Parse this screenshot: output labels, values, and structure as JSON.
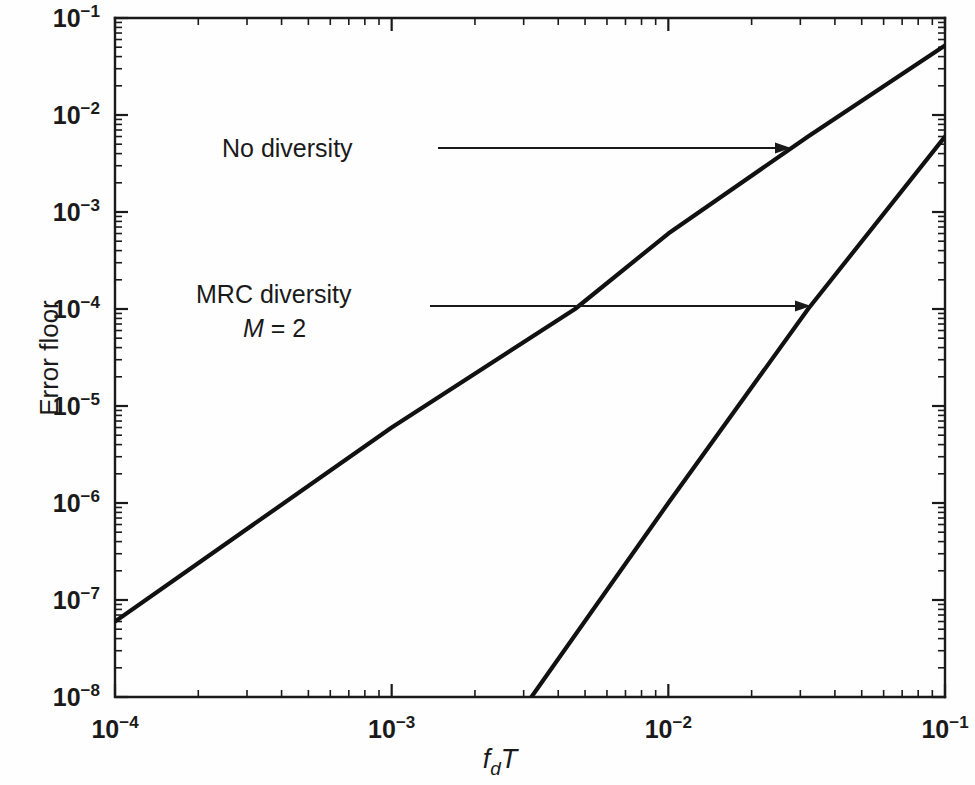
{
  "chart_data": {
    "type": "line",
    "title": "",
    "xlabel": "f_dT",
    "xlabel_parts": {
      "base": "f",
      "sub": "d",
      "tail": "T"
    },
    "ylabel": "Error floor",
    "xscale": "log",
    "yscale": "log",
    "xlim": [
      0.0001,
      0.1
    ],
    "ylim": [
      1e-08,
      0.1
    ],
    "grid": false,
    "legend": "none (inline annotations with arrows)",
    "x_tick_labels": [
      "10−4",
      "10−3",
      "10−2",
      "10−1"
    ],
    "x_tick_bases": [
      "10",
      "10",
      "10",
      "10"
    ],
    "x_tick_exponents": [
      "−4",
      "−3",
      "−2",
      "−1"
    ],
    "x_tick_values": [
      0.0001,
      0.001,
      0.01,
      0.1
    ],
    "y_tick_labels": [
      "10−1",
      "10−2",
      "10−3",
      "10−4",
      "10−5",
      "10−6",
      "10−7",
      "10−8"
    ],
    "y_tick_bases": [
      "10",
      "10",
      "10",
      "10",
      "10",
      "10",
      "10",
      "10"
    ],
    "y_tick_exponents": [
      "−1",
      "−2",
      "−3",
      "−4",
      "−5",
      "−6",
      "−7",
      "−8"
    ],
    "y_tick_values": [
      0.1,
      0.01,
      0.001,
      0.0001,
      1e-05,
      1e-06,
      1e-07,
      1e-08
    ],
    "series": [
      {
        "name": "No diversity",
        "slope": 2,
        "color": "#111111",
        "points": [
          {
            "x": 0.0001,
            "y": 6e-08
          },
          {
            "x": 0.001,
            "y": 6e-06
          },
          {
            "x": 0.0046,
            "y": 0.0001
          },
          {
            "x": 0.01,
            "y": 0.0006
          },
          {
            "x": 0.032,
            "y": 0.006
          },
          {
            "x": 0.1,
            "y": 0.052
          }
        ]
      },
      {
        "name": "MRC diversity M = 2",
        "slope": 4,
        "color": "#111111",
        "points": [
          {
            "x": 0.0032,
            "y": 1e-08
          },
          {
            "x": 0.01,
            "y": 1e-06
          },
          {
            "x": 0.032,
            "y": 0.0001
          },
          {
            "x": 0.1,
            "y": 0.006
          }
        ]
      }
    ],
    "annotations": [
      {
        "id": "no-diversity",
        "text": "No diversity",
        "text_x": 0.00041,
        "text_y": 0.0065,
        "arrow_from_x": 0.00205,
        "arrow_from_y": 0.005,
        "arrow_to_x": 0.0215,
        "arrow_to_y": 0.005
      },
      {
        "id": "mrc-diversity",
        "line1": "MRC diversity",
        "line2_italic": "M",
        "line2_rest": " = 2",
        "line2": "M = 2",
        "text_x": 0.00024,
        "text_y": 0.00013,
        "arrow_from_x": 0.00225,
        "arrow_from_y": 0.0001,
        "arrow_to_x": 0.0285,
        "arrow_to_y": 0.0001
      }
    ]
  },
  "figure": {
    "background": "#fefefe",
    "axis_color": "#1a1a1a",
    "curve_color": "#111111"
  }
}
